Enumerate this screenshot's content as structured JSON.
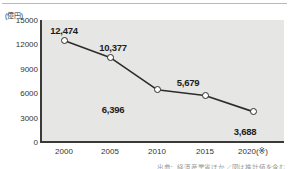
{
  "chart_data": {
    "type": "line",
    "title": "",
    "subtitle": "",
    "xlabel": "",
    "ylabel": "",
    "unit_label": "(億円)",
    "categories": [
      "2000",
      "2005",
      "2010",
      "2015",
      "2020"
    ],
    "x_tick_labels": [
      "2000",
      "2005",
      "2010",
      "2015",
      "2020(※)"
    ],
    "values": [
      12474,
      10377,
      6396,
      5679,
      3688
    ],
    "point_labels": [
      "12,474",
      "10,377",
      "6,396",
      "5,679",
      "3,688"
    ],
    "label_positions": [
      "above",
      "above",
      "below",
      "above",
      "below"
    ],
    "ylim": [
      0,
      15000
    ],
    "y_ticks": [
      0,
      3000,
      6000,
      9000,
      12000,
      15000
    ],
    "y_tick_labels": [
      "0",
      "3000",
      "6000",
      "9000",
      "12000",
      "15000"
    ],
    "grid": false,
    "legend": "none",
    "marker": "open-circle",
    "colors": {
      "line": "#2c2c2a",
      "marker_fill": "#ffffff",
      "marker_edge": "#2c2c2a",
      "plot_background": "#e6e6e4",
      "axis": "#3a3a38",
      "text": "#1d1d1b"
    }
  },
  "footer": {
    "source_note": "出典：経済産業省ほか／図は推計値を含む"
  }
}
